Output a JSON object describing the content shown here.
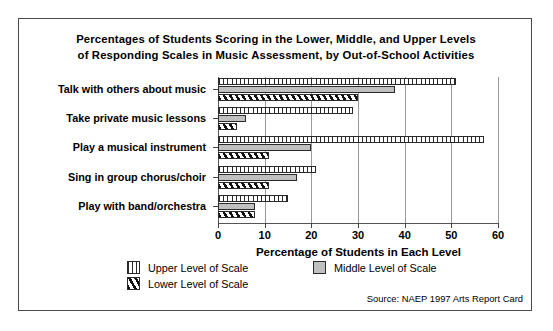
{
  "figure": {
    "title_line1": "Percentages of Students Scoring in the Lower, Middle, and Upper Levels",
    "title_line2": "of Responding Scales in Music Assessment, by Out-of-School Activities",
    "source_note": "Source: NAEP 1997 Arts Report Card"
  },
  "legend": {
    "upper_label": "Upper Level of Scale",
    "middle_label": "Middle Level of Scale",
    "lower_label": "Lower Level of Scale",
    "upper_swatch": "vertical-hatch-swatch",
    "middle_swatch": "gray-fill-swatch",
    "lower_swatch": "diagonal-hatch-swatch"
  },
  "colors": {
    "upper_fill": "#ffffff",
    "upper_hatch": "#2a2a2a",
    "middle_fill": "#c0c0c0",
    "lower_hatch": "#111111",
    "outline": "#2a2a2a",
    "gridline": "#9a9a9a",
    "frame": "#4a4a4a"
  },
  "chart_data": {
    "type": "bar",
    "orientation": "horizontal",
    "title": "Percentages of Students Scoring in the Lower, Middle, and Upper Levels of Responding Scales in Music Assessment, by Out-of-School Activities",
    "xlabel": "Percentage of Students in Each Level",
    "ylabel": "",
    "xlim": [
      0,
      60
    ],
    "xticks": [
      0,
      10,
      20,
      30,
      40,
      50,
      60
    ],
    "xticklabels": [
      "0",
      "10",
      "20",
      "30",
      "40",
      "50",
      "60"
    ],
    "grid": "vertical",
    "legend_position": "bottom-left",
    "categories": [
      "Talk with others about music",
      "Take private music lessons",
      "Play a musical instrument",
      "Sing in group chorus/choir",
      "Play with band/orchestra"
    ],
    "series": [
      {
        "name": "Upper Level of Scale",
        "values": [
          51,
          29,
          57,
          21,
          15
        ]
      },
      {
        "name": "Middle Level of Scale",
        "values": [
          38,
          6,
          20,
          17,
          8
        ]
      },
      {
        "name": "Lower Level of Scale",
        "values": [
          30,
          4,
          11,
          11,
          8
        ]
      }
    ],
    "source": "NAEP 1997 Arts Report Card"
  }
}
